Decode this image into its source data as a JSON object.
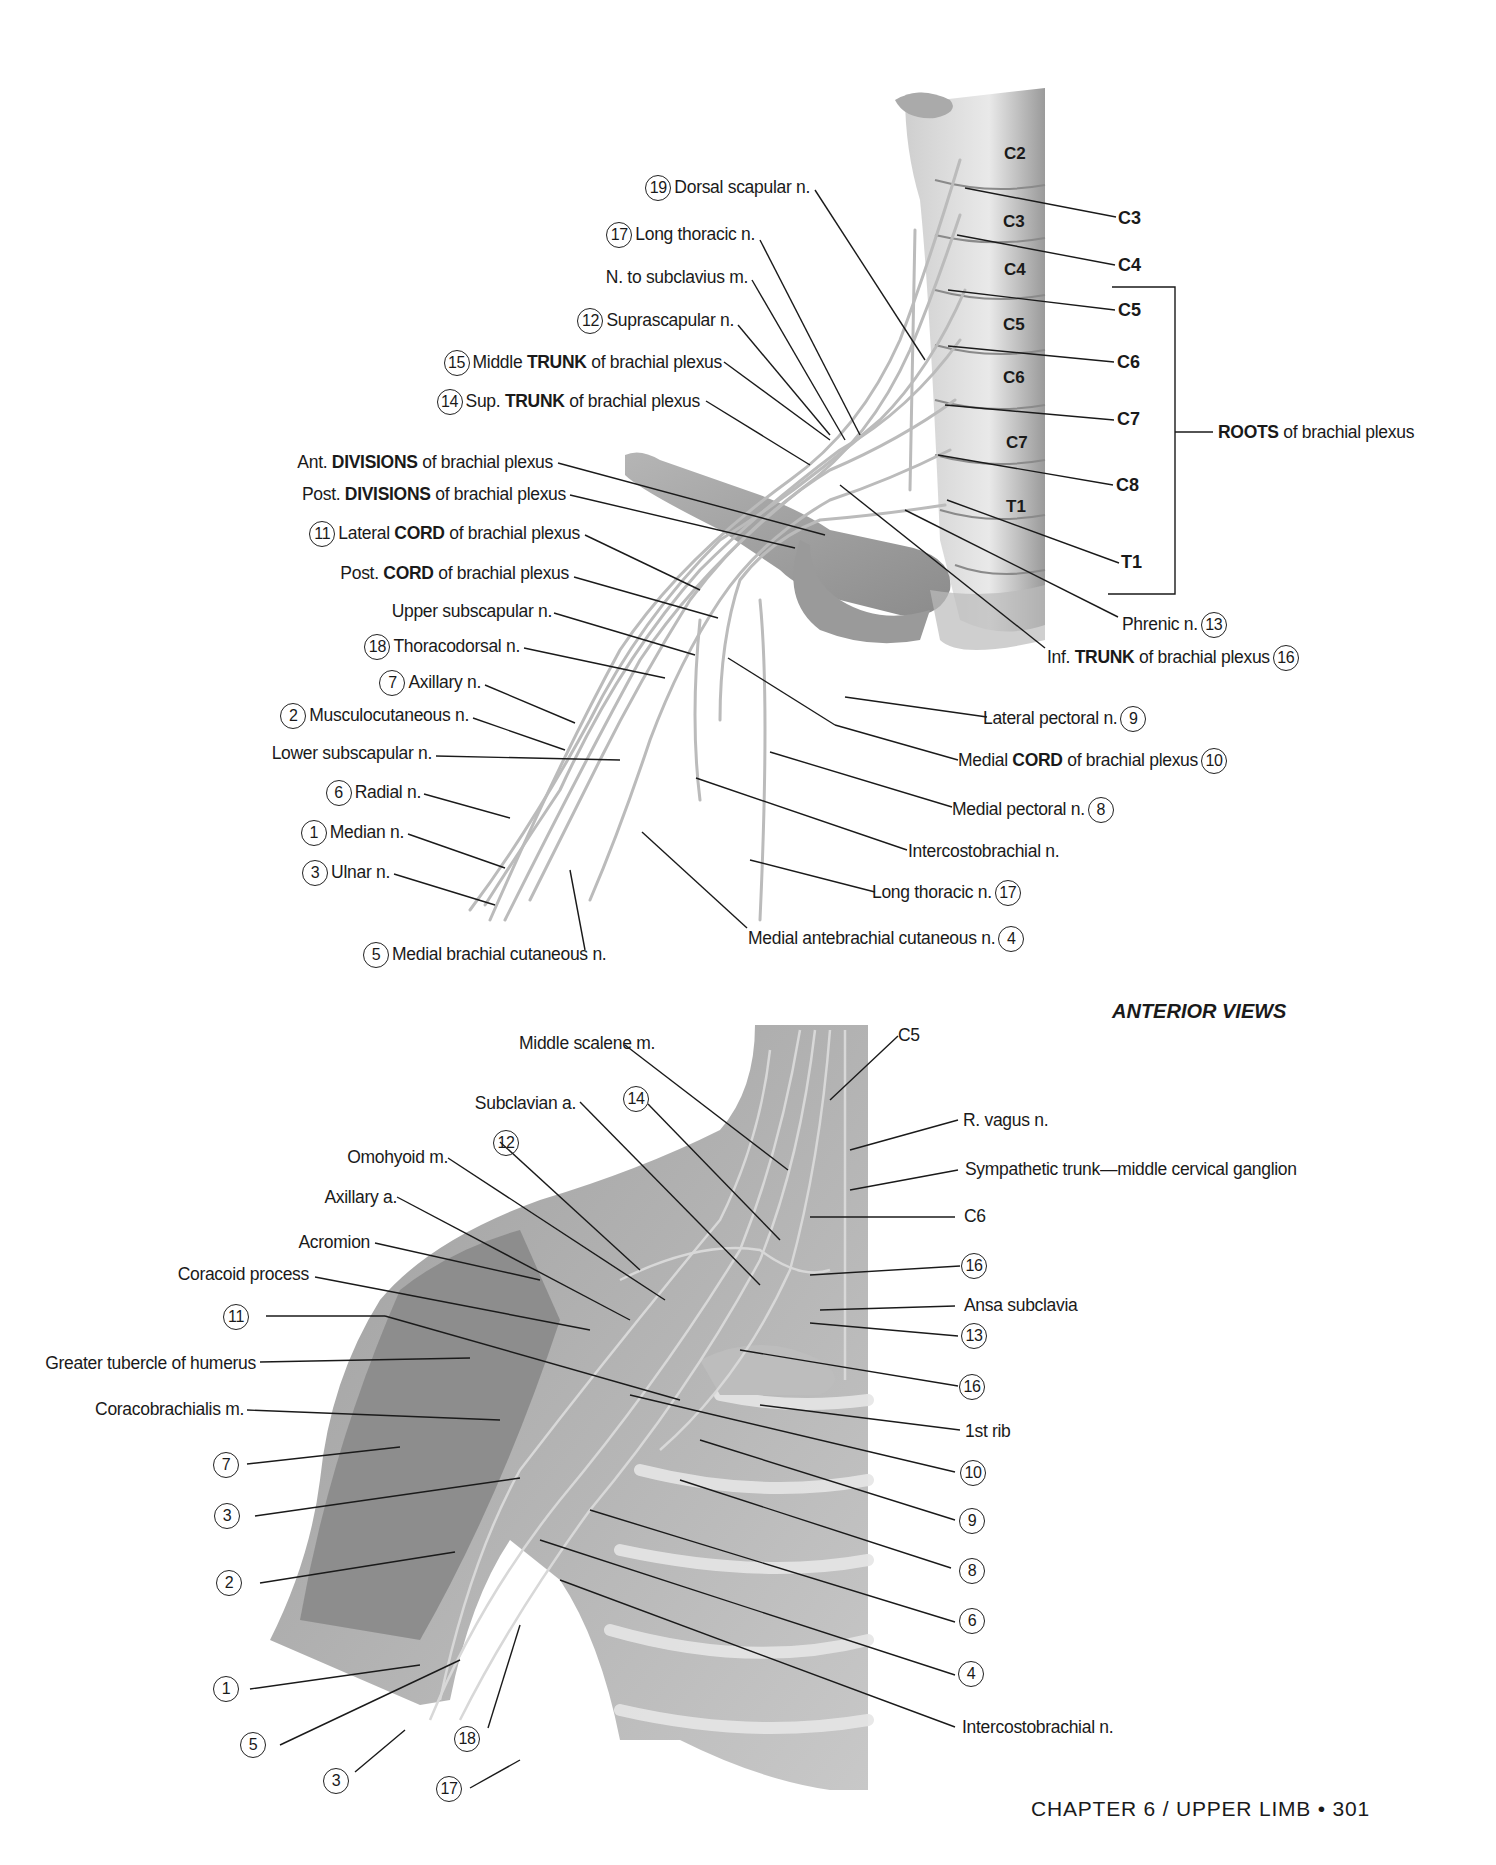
{
  "top_figure": {
    "vertebrae": [
      "C2",
      "C3",
      "C4",
      "C5",
      "C6",
      "C7",
      "T1"
    ],
    "roots": [
      "C3",
      "C4",
      "C5",
      "C6",
      "C7",
      "C8",
      "T1"
    ],
    "roots_bracket_label_bold": "ROOTS",
    "roots_bracket_label_rest": " of brachial plexus",
    "left_labels": [
      {
        "num": "19",
        "pre": "Dorsal scapular n.",
        "bold": "",
        "post": ""
      },
      {
        "num": "17",
        "pre": "Long thoracic n.",
        "bold": "",
        "post": ""
      },
      {
        "num": "",
        "pre": "N. to subclavius m.",
        "bold": "",
        "post": ""
      },
      {
        "num": "12",
        "pre": "Suprascapular n.",
        "bold": "",
        "post": ""
      },
      {
        "num": "15",
        "pre": "Middle ",
        "bold": "TRUNK",
        "post": " of brachial plexus"
      },
      {
        "num": "14",
        "pre": "Sup. ",
        "bold": "TRUNK",
        "post": " of brachial plexus"
      },
      {
        "num": "",
        "pre": "Ant. ",
        "bold": "DIVISIONS",
        "post": " of brachial plexus"
      },
      {
        "num": "",
        "pre": "Post. ",
        "bold": "DIVISIONS",
        "post": " of brachial plexus"
      },
      {
        "num": "11",
        "pre": "Lateral ",
        "bold": "CORD",
        "post": " of brachial plexus"
      },
      {
        "num": "",
        "pre": "Post. ",
        "bold": "CORD",
        "post": " of brachial plexus"
      },
      {
        "num": "",
        "pre": "Upper subscapular n.",
        "bold": "",
        "post": ""
      },
      {
        "num": "18",
        "pre": "Thoracodorsal n.",
        "bold": "",
        "post": ""
      },
      {
        "num": "7",
        "pre": "Axillary n.",
        "bold": "",
        "post": ""
      },
      {
        "num": "2",
        "pre": "Musculocutaneous n.",
        "bold": "",
        "post": ""
      },
      {
        "num": "",
        "pre": "Lower subscapular n.",
        "bold": "",
        "post": ""
      },
      {
        "num": "6",
        "pre": "Radial n.",
        "bold": "",
        "post": ""
      },
      {
        "num": "1",
        "pre": "Median n.",
        "bold": "",
        "post": ""
      },
      {
        "num": "3",
        "pre": "Ulnar n.",
        "bold": "",
        "post": ""
      },
      {
        "num": "5",
        "pre": "Medial brachial cutaneous n.",
        "bold": "",
        "post": ""
      }
    ],
    "right_labels": [
      {
        "pre": "Phrenic n.",
        "bold": "",
        "post": "",
        "num": "13"
      },
      {
        "pre": "Inf. ",
        "bold": "TRUNK",
        "post": " of brachial plexus",
        "num": "16"
      },
      {
        "pre": "Lateral pectoral n.",
        "bold": "",
        "post": "",
        "num": "9"
      },
      {
        "pre": "Medial ",
        "bold": "CORD",
        "post": " of brachial plexus",
        "num": "10"
      },
      {
        "pre": "Medial pectoral n.",
        "bold": "",
        "post": "",
        "num": "8"
      },
      {
        "pre": "Intercostobrachial n.",
        "bold": "",
        "post": "",
        "num": ""
      },
      {
        "pre": "Long thoracic n.",
        "bold": "",
        "post": "",
        "num": "17"
      },
      {
        "pre": "Medial antebrachial cutaneous n.",
        "bold": "",
        "post": "",
        "num": "4"
      }
    ]
  },
  "view_title": "ANTERIOR VIEWS",
  "bottom_figure": {
    "top_labels": [
      {
        "num": "",
        "text": "Middle scalene m."
      },
      {
        "num": "",
        "text": "Subclavian a."
      },
      {
        "num": "14",
        "text": ""
      },
      {
        "num": "",
        "text": "Omohyoid m."
      },
      {
        "num": "12",
        "text": ""
      },
      {
        "num": "",
        "text": "Axillary a."
      },
      {
        "num": "",
        "text": "C5"
      }
    ],
    "left_labels": [
      {
        "num": "",
        "text": "Acromion"
      },
      {
        "num": "",
        "text": "Coracoid process"
      },
      {
        "num": "11",
        "text": ""
      },
      {
        "num": "",
        "text": "Greater tubercle of humerus"
      },
      {
        "num": "",
        "text": "Coracobrachialis m."
      },
      {
        "num": "7",
        "text": ""
      },
      {
        "num": "3",
        "text": ""
      },
      {
        "num": "2",
        "text": ""
      },
      {
        "num": "1",
        "text": ""
      },
      {
        "num": "5",
        "text": ""
      },
      {
        "num": "3",
        "text": ""
      },
      {
        "num": "18",
        "text": ""
      },
      {
        "num": "17",
        "text": ""
      }
    ],
    "right_labels": [
      {
        "num": "",
        "text": "R. vagus n."
      },
      {
        "num": "",
        "text": "Sympathetic trunk—middle cervical ganglion"
      },
      {
        "num": "",
        "text": "C6"
      },
      {
        "num": "16",
        "text": ""
      },
      {
        "num": "",
        "text": "Ansa subclavia"
      },
      {
        "num": "13",
        "text": ""
      },
      {
        "num": "16",
        "text": ""
      },
      {
        "num": "",
        "text": "1st rib"
      },
      {
        "num": "10",
        "text": ""
      },
      {
        "num": "9",
        "text": ""
      },
      {
        "num": "8",
        "text": ""
      },
      {
        "num": "6",
        "text": ""
      },
      {
        "num": "4",
        "text": ""
      },
      {
        "num": "",
        "text": "Intercostobrachial n."
      }
    ]
  },
  "footer": "CHAPTER 6 / UPPER LIMB • 301"
}
